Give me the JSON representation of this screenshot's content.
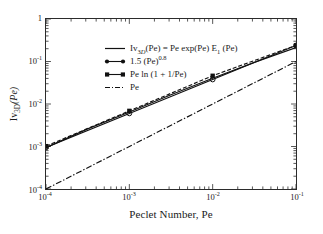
{
  "chart_data": {
    "type": "line",
    "title": "",
    "xlabel": "Peclet Number, Pe",
    "ylabel": "Iv3D(Pe)",
    "xscale": "log",
    "yscale": "log",
    "xlim": [
      0.0001,
      0.1
    ],
    "ylim": [
      0.0001,
      1
    ],
    "grid": false,
    "legend_position": "upper-left",
    "xticks": [
      "10-4",
      "10-3",
      "10-2",
      "10-1"
    ],
    "xtick_values": [
      0.0001,
      0.001,
      0.01,
      0.1
    ],
    "yticks": [
      "10-4",
      "10-3",
      "10-2",
      "10-1",
      "1"
    ],
    "ytick_values": [
      0.0001,
      0.001,
      0.01,
      0.1,
      1
    ],
    "series": [
      {
        "name": "Iv3D(Pe) = Pe exp(Pe) E1 (Pe)",
        "style": "solid",
        "marker": "none",
        "color": "#111111",
        "x": [
          0.0001,
          0.000316,
          0.001,
          0.00316,
          0.01,
          0.0316,
          0.1
        ],
        "values": [
          0.00094,
          0.0026,
          0.0065,
          0.0166,
          0.0403,
          0.0955,
          0.2128
        ]
      },
      {
        "name": "1.5 (Pe)0.8",
        "style": "solid",
        "marker": "circle",
        "color": "#111111",
        "x": [
          0.0001,
          0.001,
          0.01,
          0.1
        ],
        "values": [
          0.00095,
          0.006,
          0.0377,
          0.238
        ]
      },
      {
        "name": "Pe ln (1 + 1/Pe)",
        "style": "dashed",
        "marker": "square",
        "color": "#111111",
        "x": [
          0.0001,
          0.001,
          0.01,
          0.1
        ],
        "values": [
          0.00102,
          0.0069,
          0.0462,
          0.2398
        ]
      },
      {
        "name": "Pe",
        "style": "dash-dot",
        "marker": "none",
        "color": "#111111",
        "x": [
          0.0001,
          0.1
        ],
        "values": [
          0.0001,
          0.1
        ]
      }
    ]
  },
  "axes": {
    "x_title": "Peclet Number, Pe",
    "y_title_main": "Iv",
    "y_title_sub": "3D",
    "y_title_tail": "(Pe)",
    "xtick_labels": [
      {
        "base": "10",
        "exp": "-4"
      },
      {
        "base": "10",
        "exp": "-3"
      },
      {
        "base": "10",
        "exp": "-2"
      },
      {
        "base": "10",
        "exp": "-1"
      }
    ],
    "ytick_labels": [
      {
        "base": "1",
        "exp": ""
      },
      {
        "base": "10",
        "exp": "-1"
      },
      {
        "base": "10",
        "exp": "-2"
      },
      {
        "base": "10",
        "exp": "-3"
      },
      {
        "base": "10",
        "exp": "-4"
      }
    ]
  },
  "legend": {
    "entries": [
      {
        "key": "line-solid",
        "text": "Iv3D(Pe) = Pe exp(Pe) E1 (Pe)"
      },
      {
        "key": "line-circle",
        "text": "1.5 (Pe)0.8"
      },
      {
        "key": "line-square",
        "text": "Pe ln (1 + 1/Pe)"
      },
      {
        "key": "line-dashdot",
        "text": "Pe"
      }
    ]
  },
  "colors": {
    "foreground": "#111111",
    "axis": "#2b2b2b",
    "background": "#ffffff"
  }
}
